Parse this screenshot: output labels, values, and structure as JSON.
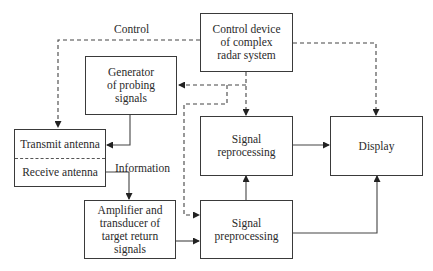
{
  "nodes": {
    "control_device": [
      "Control device",
      "of complex",
      "radar system"
    ],
    "generator": [
      "Generator",
      "of probing",
      "signals"
    ],
    "transmit_antenna": "Transmit antenna",
    "receive_antenna": "Receive antenna",
    "signal_reprocessing": [
      "Signal",
      "reprocessing"
    ],
    "display": "Display",
    "amplifier": [
      "Amplifier and",
      "transducer of",
      "target return",
      "signals"
    ],
    "signal_preprocessing": [
      "Signal",
      "preprocessing"
    ]
  },
  "labels": {
    "control": "Control",
    "information": "Information"
  },
  "edges": [
    {
      "from": "control_device",
      "to": "transmit_antenna",
      "style": "dashed",
      "label": "Control"
    },
    {
      "from": "control_device",
      "to": "generator",
      "style": "dashed"
    },
    {
      "from": "control_device",
      "to": "signal_reprocessing",
      "style": "dashed"
    },
    {
      "from": "control_device",
      "to": "signal_preprocessing",
      "style": "dashed"
    },
    {
      "from": "control_device",
      "to": "display",
      "style": "dashed"
    },
    {
      "from": "generator",
      "to": "transmit_antenna",
      "style": "solid"
    },
    {
      "from": "receive_antenna",
      "to": "amplifier",
      "style": "solid",
      "label": "Information"
    },
    {
      "from": "amplifier",
      "to": "signal_preprocessing",
      "style": "solid"
    },
    {
      "from": "signal_preprocessing",
      "to": "signal_reprocessing",
      "style": "solid"
    },
    {
      "from": "signal_reprocessing",
      "to": "display",
      "style": "solid"
    },
    {
      "from": "signal_preprocessing",
      "to": "display",
      "style": "solid"
    }
  ]
}
